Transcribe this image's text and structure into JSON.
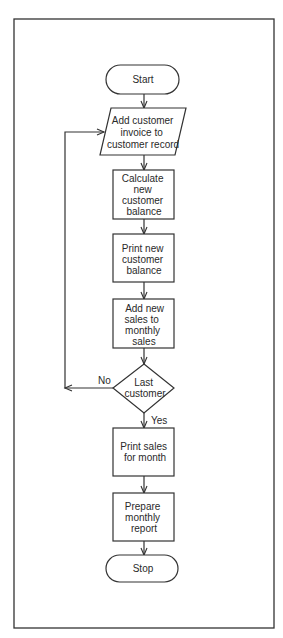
{
  "diagram": {
    "type": "flowchart",
    "colors": {
      "stroke": "#333333",
      "background": "#ffffff",
      "text": "#2a2a2a"
    },
    "nodes": [
      {
        "id": "start",
        "shape": "terminal",
        "lines": [
          "Start"
        ]
      },
      {
        "id": "add-invoice",
        "shape": "parallelogram",
        "lines": [
          "Add customer",
          "invoice to",
          "customer record"
        ]
      },
      {
        "id": "calc-balance",
        "shape": "process",
        "lines": [
          "Calculate",
          "new",
          "customer",
          "balance"
        ]
      },
      {
        "id": "print-balance",
        "shape": "process",
        "lines": [
          "Print new",
          "customer",
          "balance"
        ]
      },
      {
        "id": "add-sales",
        "shape": "process",
        "lines": [
          "Add new",
          "sales to",
          "monthly",
          "sales"
        ]
      },
      {
        "id": "last-customer",
        "shape": "decision",
        "lines": [
          "Last",
          "customer"
        ]
      },
      {
        "id": "print-sales",
        "shape": "process",
        "lines": [
          "Print sales",
          "for month"
        ]
      },
      {
        "id": "prepare-report",
        "shape": "process",
        "lines": [
          "Prepare",
          "monthly",
          "report"
        ]
      },
      {
        "id": "stop",
        "shape": "terminal",
        "lines": [
          "Stop"
        ]
      }
    ],
    "edges": [
      {
        "from": "start",
        "to": "add-invoice"
      },
      {
        "from": "add-invoice",
        "to": "calc-balance"
      },
      {
        "from": "calc-balance",
        "to": "print-balance"
      },
      {
        "from": "print-balance",
        "to": "add-sales"
      },
      {
        "from": "add-sales",
        "to": "last-customer"
      },
      {
        "from": "last-customer",
        "to": "add-invoice",
        "label": "No"
      },
      {
        "from": "last-customer",
        "to": "print-sales",
        "label": "Yes"
      },
      {
        "from": "print-sales",
        "to": "prepare-report"
      },
      {
        "from": "prepare-report",
        "to": "stop"
      }
    ],
    "labels": {
      "no": "No",
      "yes": "Yes"
    }
  }
}
